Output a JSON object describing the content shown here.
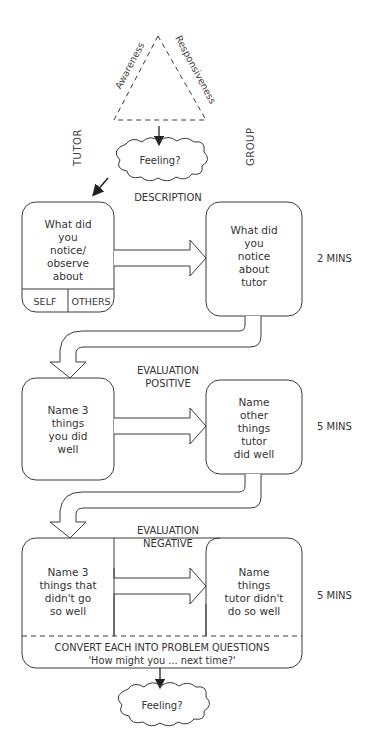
{
  "triangle": {
    "left_label": "Awareness",
    "right_label": "Responsiveness"
  },
  "side_labels": {
    "left": "TUTOR",
    "right": "GROUP"
  },
  "top_cloud": {
    "label": "Feeling?"
  },
  "bottom_cloud": {
    "label": "Feeling?"
  },
  "stages": [
    {
      "heading": [
        "DESCRIPTION"
      ],
      "tutor_box": [
        "What did",
        "you",
        "notice/",
        "observe",
        "about"
      ],
      "tutor_sub_cells": [
        "SELF",
        "OTHERS"
      ],
      "group_box": [
        "What did",
        "you",
        "notice",
        "about",
        "tutor"
      ],
      "time": "2 MINS"
    },
    {
      "heading": [
        "EVALUATION",
        "POSITIVE"
      ],
      "tutor_box": [
        "Name 3",
        "things",
        "you did",
        "well"
      ],
      "group_box": [
        "Name",
        "other",
        "things",
        "tutor",
        "did well"
      ],
      "time": "5 MINS"
    },
    {
      "heading": [
        "EVALUATION",
        "NEGATIVE"
      ],
      "tutor_box": [
        "Name 3",
        "things that",
        "didn't go",
        "so well"
      ],
      "group_box": [
        "Name",
        "things",
        "tutor didn't",
        "do so well"
      ],
      "time": "5 MINS"
    }
  ],
  "convert": {
    "line1": "CONVERT EACH INTO PROBLEM QUESTIONS",
    "line2": "'How might you ... next time?'"
  },
  "colors": {
    "stroke": "#3a3a3a",
    "text": "#333333",
    "background": "#ffffff"
  }
}
